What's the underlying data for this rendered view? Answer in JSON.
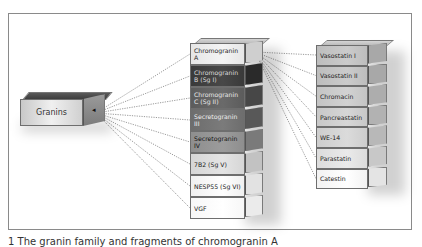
{
  "diagram": {
    "source": {
      "label": "Granins"
    },
    "granins": [
      {
        "label": "Chromogranin A",
        "front": "#e6e6e6",
        "side": "#cfcfcf"
      },
      {
        "label": "Chromogranin B (Sg I)",
        "front": "#3a3a3a",
        "side": "#2a2a2a",
        "text": "#dddddd"
      },
      {
        "label": "Chromogranin C (Sg II)",
        "front": "#5c5c5c",
        "side": "#474747",
        "text": "#e8e8e8"
      },
      {
        "label": "Secretogranin III",
        "front": "#6d6d6d",
        "side": "#585858",
        "text": "#efefef"
      },
      {
        "label": "Secretogranin IV",
        "front": "#8e8e8e",
        "side": "#7a7a7a",
        "text": "#111111"
      },
      {
        "label": "7B2 (Sg V)",
        "front": "#d6d6d6",
        "side": "#c2c2c2"
      },
      {
        "label": "NESP55 (Sg VI)",
        "front": "#f0f0f0",
        "side": "#e2e2e2"
      },
      {
        "label": "VGF",
        "front": "#f7f7f7",
        "side": "#ebebeb"
      }
    ],
    "peptides": [
      {
        "label": "Vasostatin I",
        "front": "#bdbdbd",
        "side": "#a8a8a8"
      },
      {
        "label": "Vasostatin II",
        "front": "#bdbdbd",
        "side": "#a8a8a8"
      },
      {
        "label": "Chromacin",
        "front": "#c4c4c4",
        "side": "#adadad"
      },
      {
        "label": "Pancreastatin",
        "front": "#c8c8c8",
        "side": "#b2b2b2"
      },
      {
        "label": "WE-14",
        "front": "#cdcdcd",
        "side": "#b8b8b8"
      },
      {
        "label": "Parastatin",
        "front": "#dcdcdc",
        "side": "#c8c8c8"
      },
      {
        "label": "Catestin",
        "front": "#f2f2f2",
        "side": "#e4e4e4"
      }
    ],
    "connector_style": "dotted",
    "connector_color": "#555555"
  },
  "caption": "1 The granin family and fragments of chromogranin A"
}
